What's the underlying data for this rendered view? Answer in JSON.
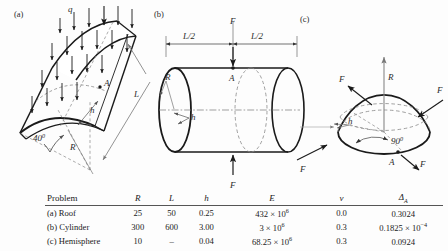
{
  "figure": {
    "panels": [
      {
        "id": "a",
        "tag": "(a)",
        "name": "roof",
        "labels": {
          "load": "q",
          "thickness": "h",
          "radius": "R",
          "length": "L",
          "point": "A",
          "angle": "40"
        },
        "angle_sup": "0"
      },
      {
        "id": "b",
        "tag": "(b)",
        "name": "cylinder",
        "labels": {
          "half_length_left": "L/2",
          "half_length_right": "L/2",
          "force_top": "F",
          "force_bottom": "F",
          "radius": "R",
          "thickness": "h",
          "point": "A"
        }
      },
      {
        "id": "c",
        "tag": "(c)",
        "name": "hemisphere",
        "labels": {
          "radius": "R",
          "thickness": "h",
          "point": "A",
          "angle": "90",
          "forces": [
            "F",
            "F",
            "F",
            "F"
          ]
        },
        "angle_sup": "0"
      }
    ]
  },
  "table": {
    "headers": {
      "problem": "Problem",
      "R": "R",
      "L": "L",
      "h": "h",
      "E": "E",
      "v": "ν",
      "delta": "Δ",
      "delta_sub": "A"
    },
    "rows": [
      {
        "problem": "(a) Roof",
        "R": "25",
        "L": "50",
        "h": "0.25",
        "E_mantissa": "432 × 10",
        "E_exp": "6",
        "v": "0.0",
        "delta_mantissa": "0.3024",
        "delta_exp": ""
      },
      {
        "problem": "(b) Cylinder",
        "R": "300",
        "L": "600",
        "h": "3.00",
        "E_mantissa": "3 × 10",
        "E_exp": "6",
        "v": "0.3",
        "delta_mantissa": "0.1825 × 10",
        "delta_exp": "−4"
      },
      {
        "problem": "(c) Hemisphere",
        "R": "10",
        "L": "–",
        "h": "0.04",
        "E_mantissa": "68.25 × 10",
        "E_exp": "6",
        "v": "0.3",
        "delta_mantissa": "0.0924",
        "delta_exp": ""
      }
    ]
  },
  "colors": {
    "line": "#1a1a1a",
    "dashed": "#6a6a6a",
    "background": "#fdfdfd"
  }
}
